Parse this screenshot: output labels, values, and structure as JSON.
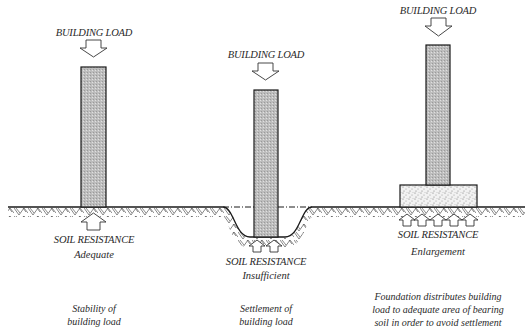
{
  "diagram": {
    "title": "",
    "colors": {
      "line": "#1a1a1a",
      "column_fill": "#c8c8c8",
      "footing_fill": "#e6e6e6",
      "text": "#2a2a2a"
    },
    "panels": [
      {
        "id": "adequate",
        "load_label": "BUILDING LOAD",
        "resistance_label": "SOIL RESISTANCE",
        "resistance_state": "Adequate",
        "caption_line1": "Stability of",
        "caption_line2": "building load",
        "resistance_arrows": 1
      },
      {
        "id": "insufficient",
        "load_label": "BUILDING LOAD",
        "resistance_label": "SOIL RESISTANCE",
        "resistance_state": "Insufficient",
        "caption_line1": "Settlement of",
        "caption_line2": "building load",
        "resistance_arrows": 2
      },
      {
        "id": "enlargement",
        "load_label": "BUILDING LOAD",
        "resistance_label": "SOIL RESISTANCE",
        "resistance_state": "Enlargement",
        "caption_line1": "Foundation distributes building",
        "caption_line2": "load to adequate area of bearing",
        "caption_line3": "soil in order to avoid settlement",
        "resistance_arrows": 5
      }
    ],
    "icons": {
      "load_arrow": "down-block-arrow-icon",
      "resistance_arrow": "up-block-arrow-icon"
    }
  }
}
